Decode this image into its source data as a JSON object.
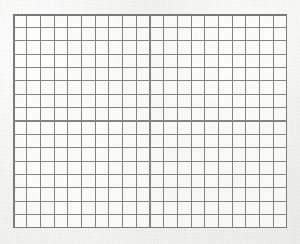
{
  "scene": {
    "subject": "graph-paper-sheet",
    "description": "Scanned sheet of blank square-ruled graph paper",
    "canvas_width_px": 300,
    "canvas_height_px": 244
  },
  "paper": {
    "background_color": "#f4f4f3",
    "highlight_color": "#f7f7f6",
    "shade_color": "#ebebe9",
    "texture": "mottled-paper-grain"
  },
  "grid": {
    "columns": 20,
    "rows": 16,
    "cell_width_px": 13.7,
    "cell_height_px": 13.375,
    "left_px": 13,
    "top_px": 14,
    "width_px": 274,
    "height_px": 214,
    "line_color": "#848484",
    "border_color": "#7a7a7a",
    "line_width_px": 1.15,
    "border_width_px": 1.5,
    "cell_fill_color": "#fcfcfb",
    "has_subdivisions": false,
    "has_labels": false,
    "content": "empty"
  }
}
